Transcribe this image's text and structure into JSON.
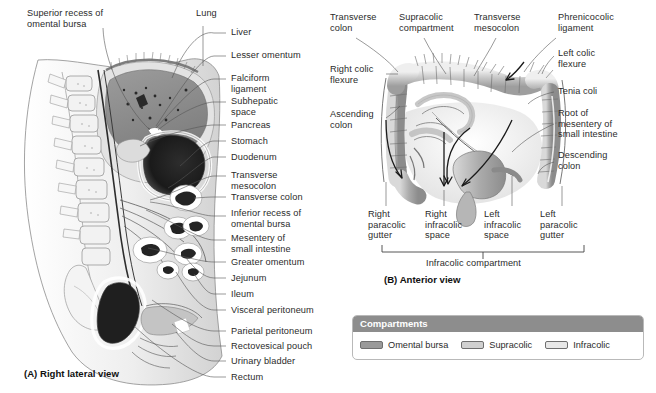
{
  "figure": {
    "panelA": {
      "caption": "(A) Right lateral view",
      "labels_top": [
        {
          "text": "Superior recess of\nomental bursa",
          "x": 27,
          "y": 8,
          "align": "left"
        },
        {
          "text": "Lung",
          "x": 196,
          "y": 8,
          "align": "left"
        }
      ],
      "labels_right": [
        {
          "text": "Liver",
          "y": 32
        },
        {
          "text": "Lesser omentum",
          "y": 55
        },
        {
          "text": "Falciform\nligament",
          "y": 76
        },
        {
          "text": "Subhepatic\nspace",
          "y": 99
        },
        {
          "text": "Pancreas",
          "y": 124
        },
        {
          "text": "Stomach",
          "y": 140
        },
        {
          "text": "Duodenum",
          "y": 156
        },
        {
          "text": "Transverse\nmesocolon",
          "y": 173
        },
        {
          "text": "Transverse colon",
          "y": 196
        },
        {
          "text": "Inferior recess of\nomental bursa",
          "y": 212
        },
        {
          "text": "Mesentery of\nsmall intestine",
          "y": 237
        },
        {
          "text": "Greater omentum",
          "y": 261
        },
        {
          "text": "Jejunum",
          "y": 277
        },
        {
          "text": "Ileum",
          "y": 293
        },
        {
          "text": "Visceral peritoneum",
          "y": 309
        },
        {
          "text": "Parietal peritoneum",
          "y": 330
        },
        {
          "text": "Rectovesical pouch",
          "y": 345
        },
        {
          "text": "Urinary bladder",
          "y": 360
        },
        {
          "text": "Rectum",
          "y": 376
        }
      ]
    },
    "panelB": {
      "caption": "(B) Anterior view",
      "labels_top": [
        {
          "text": "Transverse\ncolon",
          "x": 330,
          "y": 14,
          "align": "left"
        },
        {
          "text": "Supracolic\ncompartment",
          "x": 400,
          "y": 14,
          "align": "left"
        },
        {
          "text": "Transverse\nmesocolon",
          "x": 474,
          "y": 14,
          "align": "left"
        },
        {
          "text": "Phrenicocolic\nligament",
          "x": 557,
          "y": 14,
          "align": "left"
        }
      ],
      "labels_left": [
        {
          "text": "Right colic\nflexure",
          "x": 330,
          "y": 68,
          "align": "left"
        },
        {
          "text": "Ascending\ncolon",
          "x": 330,
          "y": 113,
          "align": "left"
        }
      ],
      "labels_right": [
        {
          "text": "Left colic\nflexure",
          "x": 557,
          "y": 50,
          "align": "left"
        },
        {
          "text": "Tenia coli",
          "x": 557,
          "y": 88,
          "align": "left"
        },
        {
          "text": "Root of\nmesentery of\nsmall intestine",
          "x": 557,
          "y": 110,
          "align": "left"
        },
        {
          "text": "Descending\ncolon",
          "x": 557,
          "y": 152,
          "align": "left"
        }
      ],
      "space_labels": [
        {
          "text": "Right\nparacolic\ngutter",
          "x": 403,
          "y": 213
        },
        {
          "text": "Right\ninfracolic\nspace",
          "x": 455,
          "y": 213
        },
        {
          "text": "Left\ninfracolic\nspace",
          "x": 508,
          "y": 213
        },
        {
          "text": "Left\nparacolic\ngutter",
          "x": 561,
          "y": 213
        }
      ],
      "bracket_label": {
        "text": "Infracolic compartment",
        "x": 483,
        "y": 261
      }
    },
    "legend": {
      "title": "Compartments",
      "items": [
        {
          "label": "Omental bursa",
          "color": "#9a9a9a"
        },
        {
          "label": "Supracolic",
          "color": "#d0d0d0"
        },
        {
          "label": "Infracolic",
          "color": "#e8e8e8"
        }
      ]
    }
  }
}
